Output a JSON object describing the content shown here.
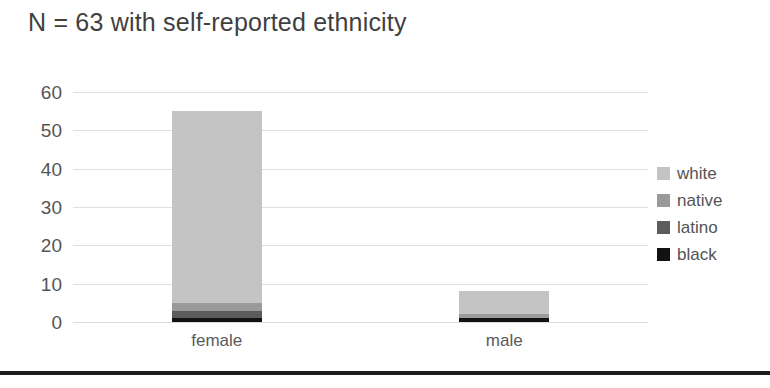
{
  "chart_data": {
    "type": "bar",
    "subtype": "stacked-bar",
    "title": "N = 63 with self-reported ethnicity",
    "xlabel": "",
    "ylabel": "",
    "categories": [
      "female",
      "male"
    ],
    "ylim": [
      0,
      60
    ],
    "yticks": [
      0,
      10,
      20,
      30,
      40,
      50,
      60
    ],
    "ytick_labels": [
      "0",
      "10",
      "20",
      "30",
      "40",
      "50",
      "60"
    ],
    "grid": true,
    "grid_axis": "y",
    "legend_position": "right",
    "series": [
      {
        "name": "black",
        "values": [
          1,
          1
        ],
        "color": "#121212"
      },
      {
        "name": "latino",
        "values": [
          2,
          0
        ],
        "color": "#5c5c5c"
      },
      {
        "name": "native",
        "values": [
          2,
          1
        ],
        "color": "#9a9a9a"
      },
      {
        "name": "white",
        "values": [
          50,
          6
        ],
        "color": "#c4c4c4"
      }
    ],
    "totals": [
      55,
      8
    ],
    "legend_order": [
      "white",
      "native",
      "latino",
      "black"
    ]
  },
  "colors": {
    "white_series": "#c4c4c4",
    "native_series": "#9a9a9a",
    "latino_series": "#5c5c5c",
    "black_series": "#121212",
    "gridline": "#dcdcdc",
    "text": "#545454",
    "title_text": "#3f3f3f",
    "bottom_rule": "#1c1c1c",
    "background": "#ffffff"
  }
}
